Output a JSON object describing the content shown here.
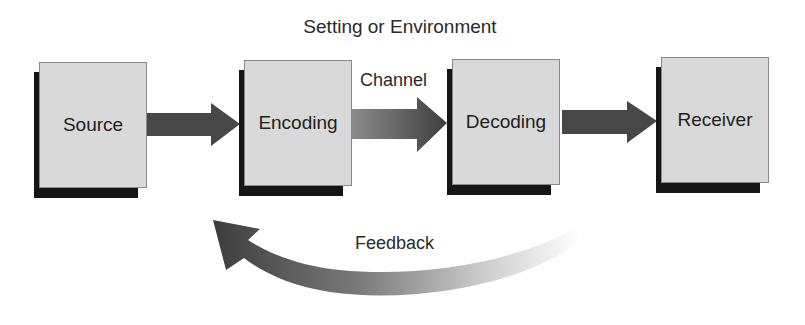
{
  "diagram": {
    "title": "Setting or Environment",
    "nodes": [
      {
        "id": "source",
        "label": "Source"
      },
      {
        "id": "encoding",
        "label": "Encoding"
      },
      {
        "id": "decoding",
        "label": "Decoding"
      },
      {
        "id": "receiver",
        "label": "Receiver"
      }
    ],
    "edges": [
      {
        "from": "source",
        "to": "encoding",
        "label": ""
      },
      {
        "from": "encoding",
        "to": "decoding",
        "label": "Channel"
      },
      {
        "from": "decoding",
        "to": "receiver",
        "label": ""
      },
      {
        "from": "receiver",
        "to": "source",
        "label": "Feedback"
      }
    ],
    "colors": {
      "box_fill": "#d9d9d9",
      "box_shadow": "#151515",
      "arrow": "#4a4a4a",
      "background": "#ffffff"
    }
  }
}
